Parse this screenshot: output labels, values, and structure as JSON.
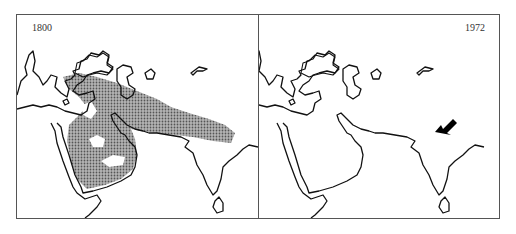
{
  "figure": {
    "panels": [
      {
        "year_label": "1800",
        "shaded_range": true,
        "arrow": false
      },
      {
        "year_label": "1972",
        "shaded_range": false,
        "arrow": true
      }
    ],
    "colors": {
      "range_fill": "#8a8a8a",
      "coastline": "#111111",
      "frame": "#555555",
      "arrow": "#000000"
    }
  }
}
